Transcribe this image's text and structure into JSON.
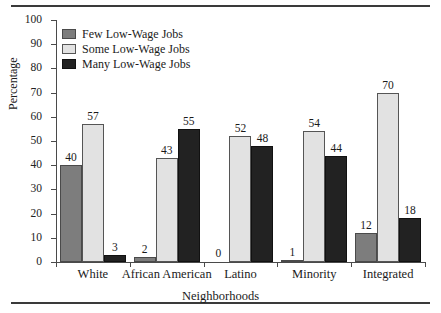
{
  "chart_data": {
    "type": "bar",
    "title": "",
    "xlabel": "Neighborhoods",
    "ylabel": "Percentage",
    "ylim": [
      0,
      100
    ],
    "ytick_step": 10,
    "yticks": [
      100,
      90,
      80,
      70,
      60,
      50,
      40,
      30,
      20,
      10,
      0
    ],
    "grid": false,
    "legend_position": "top-left",
    "categories": [
      "White",
      "African American",
      "Latino",
      "Minority",
      "Integrated"
    ],
    "series": [
      {
        "name": "Few Low-Wage Jobs",
        "color": "#7d7d7d",
        "values": [
          40,
          2,
          0,
          1,
          12
        ]
      },
      {
        "name": "Some Low-Wage Jobs",
        "color": "#e2e2e2",
        "values": [
          57,
          43,
          52,
          54,
          70
        ]
      },
      {
        "name": "Many Low-Wage Jobs",
        "color": "#222222",
        "values": [
          3,
          55,
          48,
          44,
          18
        ]
      }
    ]
  }
}
